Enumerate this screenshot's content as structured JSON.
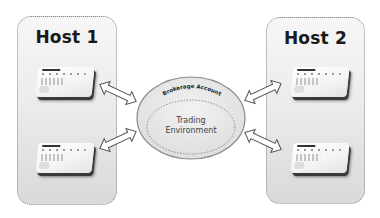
{
  "diagram": {
    "hosts": [
      {
        "id": "host-1",
        "title": "Host 1",
        "devices": 2
      },
      {
        "id": "host-2",
        "title": "Host 2",
        "devices": 2
      }
    ],
    "center": {
      "outer_label": "Brokerage Account",
      "inner_label_line1": "Trading",
      "inner_label_line2": "Environment"
    },
    "connections": [
      {
        "from": "host-1 device 1",
        "to": "Brokerage Account",
        "type": "bidirectional"
      },
      {
        "from": "host-1 device 2",
        "to": "Brokerage Account",
        "type": "bidirectional"
      },
      {
        "from": "host-2 device 1",
        "to": "Brokerage Account",
        "type": "bidirectional"
      },
      {
        "from": "host-2 device 2",
        "to": "Brokerage Account",
        "type": "bidirectional"
      }
    ],
    "colors": {
      "host_fill_top": "#f6f6f6",
      "host_fill_bottom": "#d9d9d9",
      "border": "#8c8c8c",
      "text": "#1a1a1a"
    }
  }
}
